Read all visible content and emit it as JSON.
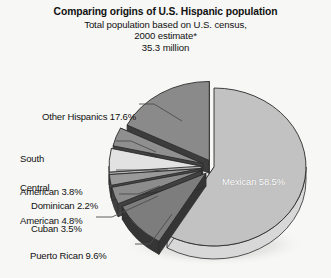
{
  "header": {
    "title": "Comparing origins of U.S. Hispanic population",
    "subtitle_line1": "Total population based on U.S. census,",
    "subtitle_line2": "2000 estimate*",
    "subtitle_line3": "35.3 million"
  },
  "colors": {
    "background": "#f7f7f5",
    "text": "#111111",
    "leader_line": "#4d4d4d",
    "outline": "#2b2b2b",
    "mexican_top": "#c2c2c2",
    "mexican_side": "#d8d8d8",
    "other_hispanics_top": "#8a8a8a",
    "other_hispanics_side": "#3c3c3c",
    "south_american_top": "#8f8f8f",
    "south_american_side": "#434343",
    "central_american_top": "#e2e2e2",
    "central_american_side": "#b4b4b4",
    "dominican_top": "#9a9a9a",
    "dominican_side": "#4a4a4a",
    "cuban_top": "#8c8c8c",
    "cuban_side": "#414141",
    "puerto_rican_top": "#7d7d7d",
    "puerto_rican_side": "#353535"
  },
  "chart_data": {
    "type": "pie",
    "title": "Comparing origins of U.S. Hispanic population",
    "subtitle": "Total population based on U.S. census, 2000 estimate* 35.3 million",
    "units": "percent",
    "total_population": "35.3 million",
    "legend_position": "callout-labels",
    "three_d": true,
    "exploded": true,
    "categories": [
      "Mexican",
      "Other Hispanics",
      "Puerto Rican",
      "Central American",
      "South American",
      "Cuban",
      "Dominican"
    ],
    "values": [
      58.5,
      17.6,
      9.6,
      4.8,
      3.8,
      3.5,
      2.2
    ],
    "slices": [
      {
        "name": "Mexican",
        "value": 58.5,
        "label": "Mexican 58.5%",
        "label_placement": "inside",
        "exploded": false,
        "color_top": "#c2c2c2",
        "color_side": "#d8d8d8"
      },
      {
        "name": "Other Hispanics",
        "value": 17.6,
        "label": "Other Hispanics 17.6%",
        "label_placement": "callout-left",
        "exploded": true,
        "color_top": "#8a8a8a",
        "color_side": "#3c3c3c"
      },
      {
        "name": "South American",
        "value": 3.8,
        "label": "South\nAmerican 3.8%",
        "label_line1": "South",
        "label_line2": "American 3.8%",
        "label_placement": "callout-left",
        "exploded": true,
        "color_top": "#8f8f8f",
        "color_side": "#434343"
      },
      {
        "name": "Central American",
        "value": 4.8,
        "label": "Central\nAmerican 4.8%",
        "label_line1": "Central",
        "label_line2": "American 4.8%",
        "label_placement": "callout-left",
        "exploded": true,
        "color_top": "#e2e2e2",
        "color_side": "#b4b4b4"
      },
      {
        "name": "Dominican",
        "value": 2.2,
        "label": "Dominican 2.2%",
        "label_placement": "callout-left",
        "exploded": true,
        "color_top": "#9a9a9a",
        "color_side": "#4a4a4a"
      },
      {
        "name": "Cuban",
        "value": 3.5,
        "label": "Cuban 3.5%",
        "label_placement": "callout-left",
        "exploded": true,
        "color_top": "#8c8c8c",
        "color_side": "#414141"
      },
      {
        "name": "Puerto Rican",
        "value": 9.6,
        "label": "Puerto Rican 9.6%",
        "label_placement": "callout-left",
        "exploded": true,
        "color_top": "#7d7d7d",
        "color_side": "#353535"
      }
    ],
    "footnote_marker": "*"
  },
  "labels": {
    "other_hispanics": "Other Hispanics 17.6%",
    "south_american_1": "South",
    "south_american_2": "American 3.8%",
    "central_american_1": "Central",
    "central_american_2": "American 4.8%",
    "dominican": "Dominican 2.2%",
    "cuban": "Cuban 3.5%",
    "puerto_rican": "Puerto Rican 9.6%",
    "mexican": "Mexican 58.5%"
  }
}
